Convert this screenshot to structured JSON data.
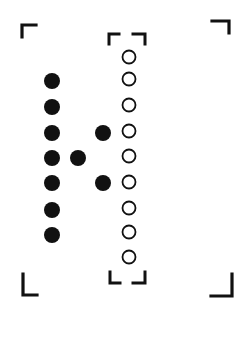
{
  "diagram": {
    "width": 239,
    "height": 337,
    "colors": {
      "ink": "#111111",
      "background": "#ffffff"
    },
    "outer_frame": {
      "corners": [
        {
          "name": "top-left",
          "d": "M22 37 L22 25 L36 25"
        },
        {
          "name": "top-right",
          "d": "M212 21 L229 21 L229 33"
        },
        {
          "name": "bottom-left",
          "d": "M23 274 L23 295 L37 295"
        },
        {
          "name": "bottom-right",
          "d": "M211 296 L232 296 L232 274"
        }
      ]
    },
    "inner_frame": {
      "corners": [
        {
          "name": "top-left",
          "d": "M109 44 L109 34 L119 34"
        },
        {
          "name": "top-right",
          "d": "M133 34 L145 34 L145 44"
        },
        {
          "name": "bottom-left",
          "d": "M110 272 L110 283 L120 283"
        },
        {
          "name": "bottom-right",
          "d": "M133 283 L145 283 L145 272"
        }
      ]
    },
    "filled_dots": [
      {
        "x": 52,
        "y": 81
      },
      {
        "x": 52,
        "y": 107
      },
      {
        "x": 52,
        "y": 133
      },
      {
        "x": 52,
        "y": 158
      },
      {
        "x": 52,
        "y": 183
      },
      {
        "x": 52,
        "y": 210
      },
      {
        "x": 52,
        "y": 235
      },
      {
        "x": 103,
        "y": 133
      },
      {
        "x": 78,
        "y": 158
      },
      {
        "x": 103,
        "y": 183
      }
    ],
    "filled_dot_radius": 8,
    "open_circles": [
      {
        "x": 129,
        "y": 57
      },
      {
        "x": 129,
        "y": 79
      },
      {
        "x": 129,
        "y": 105
      },
      {
        "x": 129,
        "y": 131
      },
      {
        "x": 129,
        "y": 156
      },
      {
        "x": 129,
        "y": 182
      },
      {
        "x": 129,
        "y": 208
      },
      {
        "x": 129,
        "y": 232
      },
      {
        "x": 129,
        "y": 257
      }
    ],
    "open_circle_radius": 6.5
  }
}
